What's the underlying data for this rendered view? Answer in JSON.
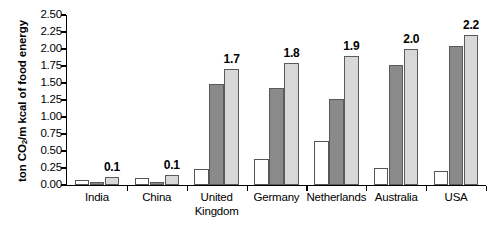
{
  "chart_data": {
    "type": "bar",
    "title": "",
    "subtitle": "",
    "xlabel": "",
    "ylabel": "ton CO2/m kcal of food energy",
    "ylabel_parts": {
      "pre": "ton CO",
      "sub": "2",
      "post": "/m kcal of food energy"
    },
    "ylim": [
      0,
      2.5
    ],
    "ytick_labels": [
      "2.50",
      "2.25",
      "2.00",
      "1.75",
      "1.50",
      "1.25",
      "1.00",
      "0.75",
      "0.50",
      "0.25",
      "0.00"
    ],
    "ytick_values": [
      2.5,
      2.25,
      2.0,
      1.75,
      1.5,
      1.25,
      1.0,
      0.75,
      0.5,
      0.25,
      0.0
    ],
    "grid": false,
    "legend": "none",
    "categories": [
      "India",
      "China",
      "United Kingdom",
      "Germany",
      "Netherlands",
      "Australia",
      "USA"
    ],
    "category_lines": [
      [
        "India"
      ],
      [
        "China"
      ],
      [
        "United",
        "Kingdom"
      ],
      [
        "Germany"
      ],
      [
        "Netherlands"
      ],
      [
        "Australia"
      ],
      [
        "USA"
      ]
    ],
    "series": [
      {
        "name": "series-1",
        "fill": "#ffffff",
        "values": [
          0.08,
          0.1,
          0.24,
          0.38,
          0.65,
          0.25,
          0.21
        ]
      },
      {
        "name": "series-2",
        "fill": "#8a8a8a",
        "values": [
          0.04,
          0.05,
          1.49,
          1.43,
          1.26,
          1.77,
          2.05
        ]
      },
      {
        "name": "series-3",
        "fill": "#d8d8d8",
        "values": [
          0.12,
          0.15,
          1.7,
          1.8,
          1.9,
          2.0,
          2.2
        ]
      }
    ],
    "value_labels": [
      "0.1",
      "0.1",
      "1.7",
      "1.8",
      "1.9",
      "2.0",
      "2.2"
    ],
    "colors": {
      "series_white": "#ffffff",
      "series_dark": "#8a8a8a",
      "series_light": "#d8d8d8",
      "axis": "#000000",
      "text": "#000000",
      "background": "#ffffff"
    }
  }
}
